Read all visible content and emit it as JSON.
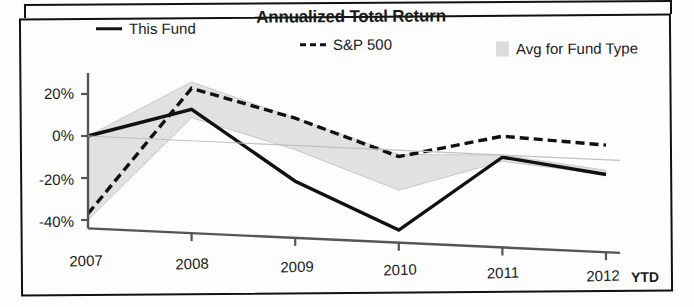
{
  "chart_data": {
    "type": "line",
    "title": "Annualized Total Return",
    "xlabel": "",
    "ylabel": "",
    "x": [
      "2007",
      "2008",
      "2009",
      "2010",
      "2011",
      "2012"
    ],
    "x_suffix_label": "YTD",
    "ylim": [
      -45,
      30
    ],
    "yticks": [
      20,
      0,
      -20,
      -40
    ],
    "ytick_labels": [
      "20%",
      "0%",
      "-20%",
      "-40%"
    ],
    "grid": false,
    "legend_position": "top",
    "series": [
      {
        "name": "This Fund",
        "style": "solid",
        "color": "#111111",
        "values": [
          0,
          15,
          -17,
          -38,
          -1,
          -7
        ]
      },
      {
        "name": "S&P 500",
        "style": "dashed",
        "color": "#111111",
        "values": [
          -37,
          25,
          13,
          -3,
          9,
          7
        ]
      },
      {
        "name": "Avg for Fund Type",
        "style": "band",
        "color": "#dcdcdc",
        "band_upper": [
          0,
          28,
          13,
          -2,
          0,
          -5
        ],
        "band_lower": [
          -40,
          11,
          -2,
          -19,
          -3,
          -7
        ]
      }
    ]
  },
  "title": "Annualized Total Return",
  "legend": {
    "fund": "This Fund",
    "sp500": "S&P 500",
    "avg": "Avg for Fund Type"
  },
  "axes": {
    "y": {
      "t20": "20%",
      "t0": "0%",
      "tm20": "-20%",
      "tm40": "-40%"
    },
    "x": {
      "y2007": "2007",
      "y2008": "2008",
      "y2009": "2009",
      "y2010": "2010",
      "y2011": "2011",
      "y2012": "2012",
      "ytd": "YTD"
    }
  },
  "colors": {
    "line": "#111111",
    "band": "#dcdcdc",
    "axis": "#555555",
    "frame": "#111111"
  }
}
